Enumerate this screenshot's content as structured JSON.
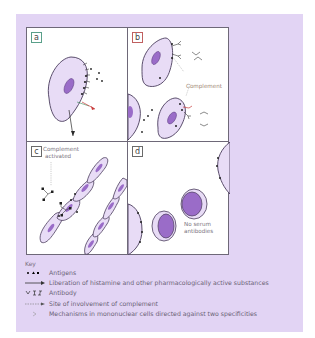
{
  "figure": {
    "panels": [
      {
        "id": "a",
        "label": "a",
        "annotations": []
      },
      {
        "id": "b",
        "label": "b",
        "annotations": [
          {
            "text": "Complement"
          }
        ]
      },
      {
        "id": "c",
        "label": "c",
        "annotations": [
          {
            "text": "Complement"
          },
          {
            "text": "activated"
          }
        ]
      },
      {
        "id": "d",
        "label": "d",
        "annotations": [
          {
            "text": "No serum"
          },
          {
            "text": "antibodies"
          }
        ]
      }
    ]
  },
  "key": {
    "title": "Key",
    "items": [
      {
        "symbol": "antigen-dots-icon",
        "label": "Antigens"
      },
      {
        "symbol": "arrow-icon",
        "label": "Liberation of histamine and other pharmacologically active substances"
      },
      {
        "symbol": "antibody-icon",
        "label": "Antibody"
      },
      {
        "symbol": "dashed-arrow-icon",
        "label": "Site of involvement of complement"
      },
      {
        "symbol": "chevron-icon",
        "label": "Mechanisms in mononuclear cells directed against two specificities"
      }
    ]
  },
  "colors": {
    "frame_bg": "#e2d4f4",
    "cell_fill": "#e8dcf6",
    "nucleus_fill": "#9a6cc8",
    "outline": "#4a3c5c",
    "complement_label": "#a08874",
    "arrow_red": "#c83c3c",
    "arrow_green": "#3c8c5c"
  }
}
